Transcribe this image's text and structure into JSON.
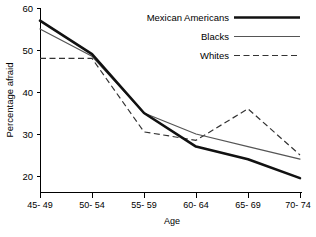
{
  "chart_data": {
    "type": "line",
    "title": "",
    "xlabel": "Age",
    "ylabel": "Percentage afraid",
    "categories": [
      "45-49",
      "50-54",
      "55-59",
      "60-64",
      "65-69",
      "70-74"
    ],
    "ylim": [
      16,
      60
    ],
    "yticks": [
      20,
      30,
      40,
      50,
      60
    ],
    "ytick_labels": [
      "20",
      "30",
      "40",
      "50",
      "60"
    ],
    "grid": false,
    "legend_position": "top-right",
    "series": [
      {
        "name": "Mexican Americans",
        "style": "thick-solid",
        "color": "#111111",
        "values": [
          57,
          49,
          35,
          27,
          24,
          19.5
        ]
      },
      {
        "name": "Blacks",
        "style": "thin-solid",
        "color": "#555555",
        "values": [
          55,
          48.5,
          35,
          30,
          27,
          24
        ]
      },
      {
        "name": "Whites",
        "style": "dashed",
        "color": "#333333",
        "values": [
          48,
          48,
          30.5,
          28.5,
          36,
          25
        ]
      }
    ]
  },
  "axes": {
    "y_title": "Percentage afraid",
    "x_title": "Age",
    "y_tick_0": "20",
    "y_tick_1": "30",
    "y_tick_2": "40",
    "y_tick_3": "50",
    "y_tick_4": "60",
    "x_tick_0": "45- 49",
    "x_tick_1": "50- 54",
    "x_tick_2": "55- 59",
    "x_tick_3": "60- 64",
    "x_tick_4": "65- 69",
    "x_tick_5": "70- 74"
  },
  "legend": {
    "items": [
      {
        "label": "Mexican Americans",
        "style": "thick-solid"
      },
      {
        "label": "Blacks",
        "style": "thin-solid"
      },
      {
        "label": "Whites",
        "style": "dashed"
      }
    ]
  }
}
